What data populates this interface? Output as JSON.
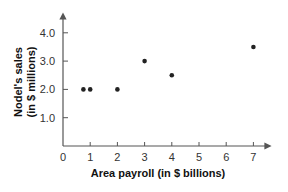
{
  "chart_data": {
    "type": "scatter",
    "title": "",
    "xlabel": "Area payroll (in $ billions)",
    "ylabel_line1": "Nodel's sales",
    "ylabel_line2": "(in $ millions)",
    "ylabel": "Nodel's sales (in $ millions)",
    "xlim": [
      0,
      7.8
    ],
    "ylim": [
      0,
      4.5
    ],
    "x_ticks": [
      "0",
      "1",
      "2",
      "3",
      "4",
      "5",
      "6",
      "7"
    ],
    "y_ticks": [
      "1.0",
      "2.0",
      "3.0",
      "4.0"
    ],
    "grid": false,
    "legend": null,
    "points": [
      {
        "x": 0.75,
        "y": 2.0
      },
      {
        "x": 1.0,
        "y": 2.0
      },
      {
        "x": 2.0,
        "y": 2.0
      },
      {
        "x": 3.0,
        "y": 3.0
      },
      {
        "x": 4.0,
        "y": 2.5
      },
      {
        "x": 7.0,
        "y": 3.5
      }
    ],
    "x": [
      0.75,
      1.0,
      2.0,
      3.0,
      4.0,
      7.0
    ],
    "y": [
      2.0,
      2.0,
      2.0,
      3.0,
      2.5,
      3.5
    ],
    "colors": {
      "axis": "#555555",
      "point": "#222222",
      "text": "#333333"
    }
  }
}
